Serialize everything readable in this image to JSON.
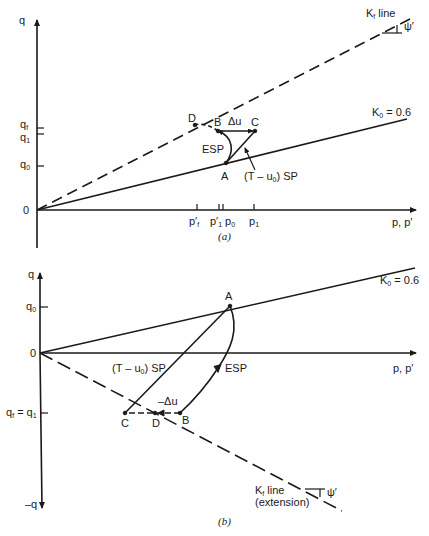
{
  "panel_a": {
    "caption": "(a)",
    "y_axis_label": "q",
    "x_axis_label": "p, p′",
    "origin_label": "0",
    "y_ticks": [
      {
        "label": "q",
        "sub": "f",
        "y": 128
      },
      {
        "label": "q",
        "sub": "1",
        "y": 134
      },
      {
        "label": "q",
        "sub": "0",
        "y": 166
      }
    ],
    "x_ticks": [
      {
        "label": "p′",
        "sub": "f",
        "x": 197
      },
      {
        "label": "p′",
        "sub": "1",
        "x": 219
      },
      {
        "label": "p",
        "sub": "0",
        "x": 223
      },
      {
        "label": "p",
        "sub": "1",
        "x": 254
      }
    ],
    "kf_line_label": "K",
    "kf_line_sub": "f",
    "kf_line_suffix": " line",
    "angle_label": "ψ′",
    "k0_label": "K",
    "k0_sub": "0",
    "k0_value": " = 0.6",
    "points": {
      "A": "A",
      "B": "B",
      "C": "C",
      "D": "D"
    },
    "delta_u_label": "Δu",
    "esp_label": "ESP",
    "tsp_label_pre": "(T – u",
    "tsp_label_sub": "0",
    "tsp_label_post": ") SP"
  },
  "panel_b": {
    "caption": "(b)",
    "y_axis_label": "q",
    "y_axis_neg_label": "–q",
    "x_axis_label": "p, p′",
    "origin_label": "0",
    "q0_label": "q",
    "q0_sub": "0",
    "qf_label": "q",
    "qf_sub": "f",
    "qf_eq": " = q",
    "q1_sub": "1",
    "k0_label": "K",
    "k0_sub": "0",
    "k0_value": " = 0.6",
    "kf_line_label": "K",
    "kf_line_sub": "f",
    "kf_line_suffix": " line",
    "kf_ext_label": "(extension)",
    "angle_label": "ψ′",
    "points": {
      "A": "A",
      "B": "B",
      "C": "C",
      "D": "D"
    },
    "delta_u_label": "–Δu",
    "esp_label": "ESP",
    "tsp_label_pre": "(T – u",
    "tsp_label_sub": "0",
    "tsp_label_post": ") SP"
  },
  "colors": {
    "ink": "#1a1a1a",
    "background": "#ffffff"
  }
}
